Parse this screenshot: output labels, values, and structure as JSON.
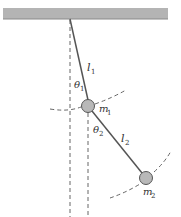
{
  "diagram": {
    "colors": {
      "ceiling": "#b4b4b4",
      "ceiling_edge": "#8a8a8a",
      "rod": "#555555",
      "bob_fill": "#b8b8b8",
      "bob_stroke": "#555555",
      "dashed": "#666666",
      "text": "#333333"
    },
    "labels": {
      "l1": {
        "main": "l",
        "sub": "1"
      },
      "theta1": {
        "main": "θ",
        "sub": "1"
      },
      "m1": {
        "main": "m",
        "sub": "1"
      },
      "theta2": {
        "main": "θ",
        "sub": "2"
      },
      "l2": {
        "main": "l",
        "sub": "2"
      },
      "m2": {
        "main": "m",
        "sub": "2"
      }
    }
  }
}
